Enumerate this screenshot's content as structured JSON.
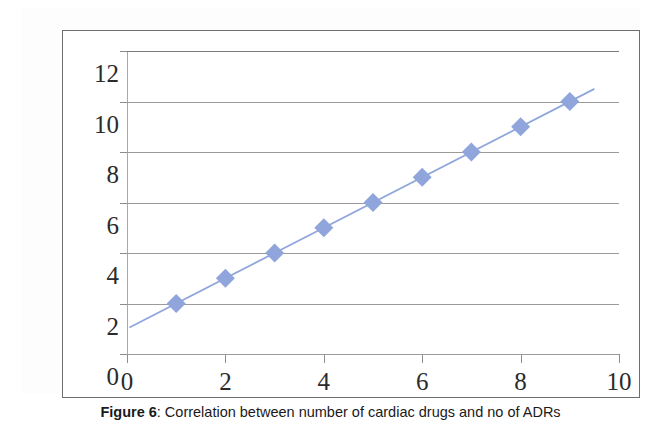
{
  "caption": {
    "label": "Figure 6",
    "separator": ":",
    "text": " Correlation between number of cardiac drugs and no of ADRs"
  },
  "colors": {
    "marker": "#8FA5DC",
    "trendline": "#8FA5DC",
    "gridline": "#9B9B9B",
    "axis_text": "#2B2B2B",
    "frame": "#6E6E6E",
    "background": "#FFFFFF"
  },
  "chart_data": {
    "type": "scatter",
    "title": "",
    "subtitle": "",
    "xlabel": "",
    "ylabel": "",
    "xlim": [
      0,
      10
    ],
    "ylim": [
      0,
      12
    ],
    "xticks": [
      0,
      2,
      4,
      6,
      8,
      10
    ],
    "yticks": [
      0,
      2,
      4,
      6,
      8,
      10,
      12
    ],
    "grid": "horizontal",
    "legend": "none",
    "marker_shape": "diamond",
    "marker_size_px": 19,
    "series": [
      {
        "name": "Number of cardiac drugs vs no of ADRs",
        "x": [
          1,
          2,
          3,
          4,
          5,
          6,
          7,
          8,
          9
        ],
        "y": [
          2,
          3,
          4,
          5,
          6,
          7,
          8,
          9,
          10
        ],
        "points": [
          {
            "x": 1,
            "y": 2
          },
          {
            "x": 2,
            "y": 3
          },
          {
            "x": 3,
            "y": 4
          },
          {
            "x": 4,
            "y": 5
          },
          {
            "x": 5,
            "y": 6
          },
          {
            "x": 6,
            "y": 7
          },
          {
            "x": 7,
            "y": 8
          },
          {
            "x": 8,
            "y": 9
          },
          {
            "x": 9,
            "y": 10
          }
        ]
      }
    ],
    "trendline": {
      "type": "linear",
      "slope": 1,
      "intercept": 1,
      "x_start": 0.05,
      "x_end": 9.5
    }
  }
}
